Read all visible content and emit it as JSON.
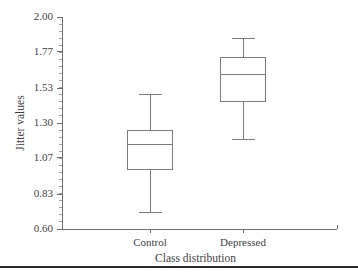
{
  "chart_data": {
    "type": "box",
    "title": "",
    "xlabel": "Class distribution",
    "ylabel": "Jitter values",
    "ylim": [
      0.6,
      2.0
    ],
    "yticks": [
      "0.60",
      "0.83",
      "1.07",
      "1.30",
      "1.53",
      "1.77",
      "2.00"
    ],
    "ytick_values": [
      0.6,
      0.83,
      1.07,
      1.3,
      1.53,
      1.77,
      2.0
    ],
    "minor_ticks": true,
    "grid": false,
    "legend": "none",
    "categories": [
      "Control",
      "Depressed"
    ],
    "boxes": [
      {
        "label": "Control",
        "whisker_low": 0.71,
        "q1": 0.99,
        "median": 1.16,
        "q3": 1.25,
        "whisker_high": 1.49
      },
      {
        "label": "Depressed",
        "whisker_low": 1.19,
        "q1": 1.44,
        "median": 1.62,
        "q3": 1.73,
        "whisker_high": 1.86
      }
    ]
  },
  "figure": {
    "background_color": "#ffffff",
    "line_color": "#7b7b7b",
    "axis_color": "#6e6e6e",
    "text_color": "#3f3f3f",
    "rule_color": "#2b2b2b"
  }
}
